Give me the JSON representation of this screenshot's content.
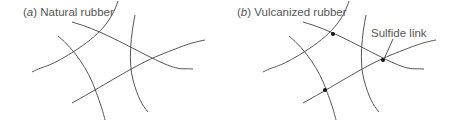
{
  "panels": [
    {
      "id": "a",
      "letter": "a",
      "title": "Natural rubber",
      "offset_x": 0,
      "crosslinks": []
    },
    {
      "id": "b",
      "letter": "b",
      "title": "Vulcanized rubber",
      "offset_x": 231,
      "crosslinks": [
        [
          102,
          34
        ],
        [
          152,
          60
        ],
        [
          94,
          90
        ]
      ],
      "annotation": {
        "label": "Sulfide link",
        "leader_from": [
          162,
          39
        ],
        "leader_to": [
          153,
          59
        ]
      }
    }
  ],
  "chains": [
    "M118,1 C112,20 100,35 73,52 S45,65 32,72",
    "M72,22 C100,30 120,42 150,57 S180,68 193,69",
    "M135,15 C131,35 128,62 133,80 S142,105 148,112",
    "M58,36 C75,50 88,70 95,89 S103,112 105,120",
    "M72,103 C110,82 135,65 160,55 S190,43 205,40"
  ],
  "colors": {
    "line": "#555555",
    "dot": "#111111",
    "text": "#555555"
  }
}
